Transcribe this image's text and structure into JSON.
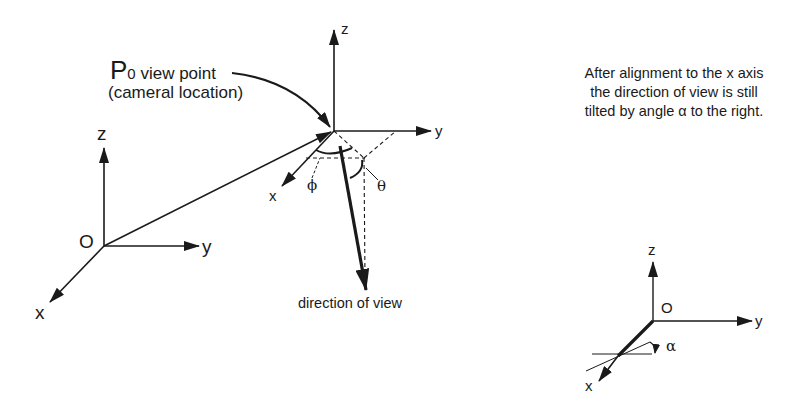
{
  "left_frame": {
    "origin_label": "O",
    "axis_x": "x",
    "axis_y": "y",
    "axis_z": "z"
  },
  "viewpoint_frame": {
    "label_main": "P",
    "label_subscript": "0",
    "label_text": " view point",
    "label_sub": "(cameral location)",
    "axis_x": "x",
    "axis_y": "y",
    "axis_z": "z",
    "angle_phi": "ϕ",
    "angle_theta": "θ",
    "direction_label": "direction of view"
  },
  "right_frame": {
    "note_lines": [
      "After alignment to the x axis",
      "the direction of view is still",
      "tilted by angle α to the right."
    ],
    "origin_label": "O",
    "axis_x": "x",
    "axis_y": "y",
    "axis_z": "z",
    "angle_alpha": "α"
  }
}
